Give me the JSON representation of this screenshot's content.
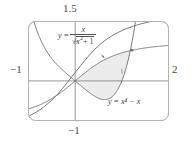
{
  "figure": {
    "title": "",
    "axis_labels": {
      "y_max": "1.5",
      "y_min": "−1",
      "x_min": "−1",
      "x_max": "2"
    },
    "curve_labels": {
      "curve1_lhs": "y =",
      "curve1_numerator": "x",
      "curve1_denominator_radicand": "x",
      "curve1_denominator_exponent": "2",
      "curve1_denominator_tail": "+ 1",
      "curve2": "y = x⁴ − x"
    },
    "colors": {
      "curve": "#666666",
      "axis": "#777777",
      "frame": "#aaaaaa",
      "shade": "#ebebeb",
      "text": "#4a4a4a"
    }
  },
  "chart_data": {
    "type": "line",
    "title": "",
    "xlabel": "",
    "ylabel": "",
    "xlim": [
      -1,
      2
    ],
    "ylim": [
      -1,
      1.5
    ],
    "grid": false,
    "legend": "inline-annotations",
    "xticks": [
      -1,
      0,
      1,
      2
    ],
    "yticks": [
      -1,
      0,
      1,
      1.5
    ],
    "shaded_region": {
      "between": [
        "y = x/sqrt(x^2+1)",
        "y = x^4 - x"
      ],
      "x_from": 0,
      "x_to": 1.2167,
      "fill": "#ebebeb"
    },
    "intersection_points": [
      {
        "x": 0,
        "y": 0
      },
      {
        "x": 1.2167,
        "y": 0.7732
      }
    ],
    "series": [
      {
        "name": "y = x/sqrt(x^2+1)",
        "expression": "x/sqrt(x^2+1)",
        "x": [
          -1,
          -0.9,
          -0.8,
          -0.7,
          -0.6,
          -0.5,
          -0.4,
          -0.3,
          -0.2,
          -0.1,
          0,
          0.1,
          0.2,
          0.3,
          0.4,
          0.5,
          0.6,
          0.7,
          0.8,
          0.9,
          1,
          1.1,
          1.2,
          1.3,
          1.4,
          1.5,
          1.6,
          1.7,
          1.8,
          1.9,
          2
        ],
        "values": [
          -0.7071,
          -0.669,
          -0.6247,
          -0.5735,
          -0.5145,
          -0.4472,
          -0.3714,
          -0.2873,
          -0.1961,
          -0.0995,
          0,
          0.0995,
          0.1961,
          0.2873,
          0.3714,
          0.4472,
          0.5145,
          0.5735,
          0.6247,
          0.669,
          0.7071,
          0.7399,
          0.7682,
          0.7926,
          0.8137,
          0.8321,
          0.848,
          0.8619,
          0.8742,
          0.885,
          0.8944
        ]
      },
      {
        "name": "y = x^4 - x",
        "expression": "x^4 - x",
        "x": [
          -1,
          -0.9,
          -0.8,
          -0.7,
          -0.6,
          -0.5,
          -0.4,
          -0.3,
          -0.2,
          -0.1,
          0,
          0.1,
          0.2,
          0.3,
          0.4,
          0.5,
          0.6,
          0.7,
          0.8,
          0.9,
          1,
          1.1,
          1.2,
          1.3,
          1.4
        ],
        "values": [
          2.0,
          1.5561,
          1.2096,
          0.9401,
          0.7296,
          0.5625,
          0.4256,
          0.3081,
          0.2016,
          0.1001,
          0,
          -0.0999,
          -0.1984,
          -0.2919,
          -0.3744,
          -0.4375,
          -0.4704,
          -0.4599,
          -0.3904,
          -0.2439,
          0,
          0.3641,
          0.8736,
          1.5561,
          2.4416
        ]
      }
    ]
  }
}
